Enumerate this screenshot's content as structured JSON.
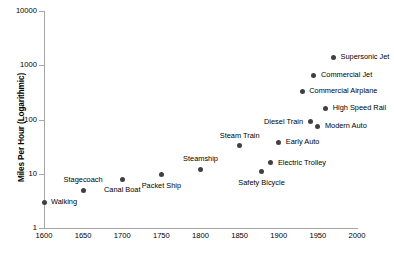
{
  "chart_data": {
    "type": "scatter",
    "title": "",
    "xlabel": "",
    "ylabel": "Miles Per Hour (Logarithmic)",
    "xlim": [
      1600,
      2000
    ],
    "ylim": [
      1,
      10000
    ],
    "yscale": "log",
    "grid": false,
    "legend": "none",
    "xticks": [
      "1600",
      "1650",
      "1700",
      "1750",
      "1800",
      "1850",
      "1900",
      "1950",
      "2000"
    ],
    "yticks": [
      "1",
      "10",
      "100",
      "1000",
      "10000"
    ],
    "marker_color": "#404040",
    "axis_color": "#a6a6a6",
    "points": [
      {
        "label": "Walking",
        "x": 1600,
        "y": 3,
        "label_pos": "right"
      },
      {
        "label": "Stagecoach",
        "x": 1650,
        "y": 5,
        "label_pos": "above"
      },
      {
        "label": "Canal Boat",
        "x": 1700,
        "y": 8,
        "label_pos": "below"
      },
      {
        "label": "Packet Ship",
        "x": 1750,
        "y": 9.5,
        "label_pos": "below"
      },
      {
        "label": "Steamship",
        "x": 1800,
        "y": 12,
        "label_pos": "above"
      },
      {
        "label": "Steam Train",
        "x": 1850,
        "y": 33,
        "label_pos": "above"
      },
      {
        "label": "Safety Bicycle",
        "x": 1878,
        "y": 11,
        "label_pos": "below"
      },
      {
        "label": "Electric Trolley",
        "x": 1890,
        "y": 16,
        "label_pos": "right"
      },
      {
        "label": "Early Auto",
        "x": 1900,
        "y": 38,
        "label_pos": "right"
      },
      {
        "label": "Commercial Airplane",
        "x": 1930,
        "y": 330,
        "label_pos": "right"
      },
      {
        "label": "Diesel Train",
        "x": 1940,
        "y": 90,
        "label_pos": "left"
      },
      {
        "label": "Commercial Jet",
        "x": 1945,
        "y": 650,
        "label_pos": "right"
      },
      {
        "label": "Modern Auto",
        "x": 1950,
        "y": 75,
        "label_pos": "right"
      },
      {
        "label": "High Speed Rail",
        "x": 1960,
        "y": 160,
        "label_pos": "right"
      },
      {
        "label": "Supersonic Jet",
        "x": 1970,
        "y": 1400,
        "label_pos": "right"
      }
    ]
  }
}
